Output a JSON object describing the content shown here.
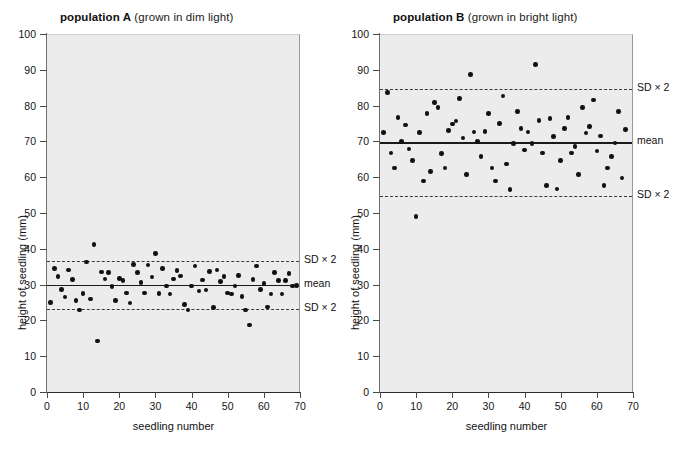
{
  "chart_data": [
    {
      "type": "scatter",
      "panel": "A",
      "title_bold": "population A",
      "title_rest": " (grown in dim light)",
      "xlabel": "seedling number",
      "ylabel": "height of seedling (mm)",
      "xlim": [
        0,
        70
      ],
      "ylim": [
        0,
        100
      ],
      "xticks": [
        0,
        10,
        20,
        30,
        40,
        50,
        60,
        70
      ],
      "yticks": [
        0,
        10,
        20,
        30,
        40,
        50,
        60,
        70,
        80,
        90,
        100
      ],
      "grid": false,
      "mean": 30.2,
      "mean_label": "mean",
      "sd2_upper": 37.0,
      "sd2_lower": 23.4,
      "sd2_label": "SD × 2",
      "x": [
        1,
        2,
        3,
        4,
        5,
        6,
        7,
        8,
        9,
        10,
        11,
        12,
        13,
        14,
        15,
        16,
        17,
        18,
        19,
        20,
        21,
        22,
        23,
        24,
        25,
        26,
        27,
        28,
        29,
        30,
        31,
        32,
        33,
        34,
        35,
        36,
        37,
        38,
        39,
        40,
        41,
        42,
        43,
        44,
        45,
        46,
        47,
        48,
        49,
        50,
        51,
        52,
        53,
        54,
        55,
        56,
        57,
        58,
        59,
        60,
        61,
        62,
        63,
        64,
        65,
        66,
        67,
        68,
        69
      ],
      "y": [
        25.3,
        34.8,
        32.6,
        28.9,
        26.8,
        34.4,
        31.7,
        25.8,
        23.2,
        27.8,
        36.6,
        26.3,
        41.5,
        14.5,
        33.8,
        31.8,
        33.7,
        29.7,
        25.9,
        32.0,
        31.4,
        27.9,
        25.1,
        35.9,
        33.6,
        30.9,
        27.9,
        35.7,
        32.4,
        38.9,
        27.8,
        34.7,
        29.9,
        27.7,
        31.9,
        34.2,
        32.7,
        24.8,
        23.2,
        29.9,
        35.5,
        28.5,
        31.6,
        28.8,
        33.9,
        23.9,
        34.4,
        31.1,
        32.6,
        27.9,
        27.7,
        29.9,
        32.9,
        26.9,
        23.2,
        19.0,
        31.7,
        35.5,
        28.9,
        30.6,
        24.0,
        27.6,
        33.6,
        31.5,
        27.6,
        31.4,
        33.3,
        29.9,
        30.1
      ]
    },
    {
      "type": "scatter",
      "panel": "B",
      "title_bold": "population B",
      "title_rest": " (grown in bright light)",
      "xlabel": "seedling number",
      "ylabel": "height of seedling (mm)",
      "xlim": [
        0,
        70
      ],
      "ylim": [
        0,
        100
      ],
      "xticks": [
        0,
        10,
        20,
        30,
        40,
        50,
        60,
        70
      ],
      "yticks": [
        0,
        10,
        20,
        30,
        40,
        50,
        60,
        70,
        80,
        90,
        100
      ],
      "grid": false,
      "mean": 70.0,
      "mean_label": "mean",
      "sd2_upper": 85.0,
      "sd2_lower": 55.0,
      "sd2_label": "SD × 2",
      "x": [
        1,
        2,
        3,
        4,
        5,
        6,
        7,
        8,
        9,
        10,
        11,
        12,
        13,
        14,
        15,
        16,
        17,
        18,
        19,
        20,
        21,
        22,
        23,
        24,
        25,
        26,
        27,
        28,
        29,
        30,
        31,
        32,
        33,
        34,
        35,
        36,
        37,
        38,
        39,
        40,
        41,
        42,
        43,
        44,
        45,
        46,
        47,
        48,
        49,
        50,
        51,
        52,
        53,
        54,
        55,
        56,
        57,
        58,
        59,
        60,
        61,
        62,
        63,
        64,
        65,
        66,
        67,
        68
      ],
      "y": [
        72.7,
        83.9,
        67.0,
        62.9,
        77.0,
        70.2,
        74.9,
        68.1,
        64.9,
        49.3,
        72.8,
        59.2,
        78.0,
        61.9,
        81.2,
        79.8,
        66.9,
        62.8,
        73.4,
        75.1,
        76.0,
        82.2,
        71.2,
        61.0,
        89.0,
        72.9,
        70.2,
        66.0,
        73.0,
        78.0,
        62.9,
        59.2,
        75.2,
        83.0,
        64.0,
        56.9,
        69.7,
        78.7,
        73.8,
        67.9,
        72.9,
        69.7,
        91.7,
        76.1,
        67.0,
        58.0,
        76.7,
        71.6,
        57.0,
        65.0,
        73.9,
        76.9,
        67.0,
        68.8,
        61.0,
        79.8,
        72.6,
        74.4,
        81.9,
        67.6,
        71.8,
        58.0,
        62.9,
        66.0,
        69.8,
        78.7,
        60.0,
        73.6
      ]
    }
  ]
}
